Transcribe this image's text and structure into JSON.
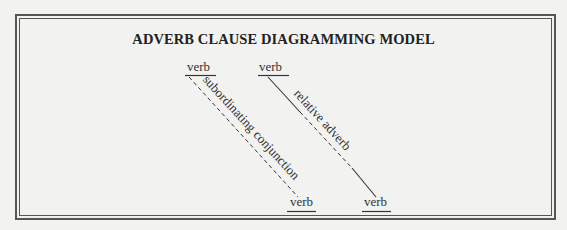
{
  "title": "ADVERB CLAUSE DIAGRAMMING MODEL",
  "diagram": {
    "left_structure": {
      "top_word": "verb",
      "connector_label": "subordinating conjunction",
      "connector_style": "dashed",
      "bottom_word": "verb"
    },
    "right_structure": {
      "top_word": "verb",
      "connector_label": "relative adverb",
      "connector_style": "solid-dashed-solid",
      "bottom_word": "verb"
    }
  },
  "colors": {
    "background": "#f2f2f0",
    "ink": "#333333",
    "border": "#555555"
  }
}
